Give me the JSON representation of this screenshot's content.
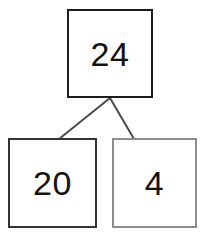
{
  "diagram": {
    "type": "number-bond",
    "title": "",
    "total": {
      "label": "24",
      "value": 24,
      "border_color": "#1c1c1c"
    },
    "parts": [
      {
        "label": "20",
        "value": 20,
        "border_color": "#333333"
      },
      {
        "label": "4",
        "value": 4,
        "border_color": "#8d8d8d"
      }
    ],
    "connector_color": "#4a4a4a",
    "background_color": "#ffffff"
  }
}
